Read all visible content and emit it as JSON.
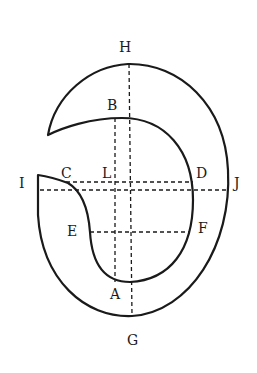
{
  "diagram": {
    "type": "geometric-construction",
    "stroke_color": "#1a1a1a",
    "background": "#ffffff",
    "labels": {
      "H": "H",
      "B": "B",
      "I": "I",
      "C": "C",
      "L": "L",
      "D": "D",
      "J": "J",
      "E": "E",
      "F": "F",
      "A": "A",
      "G": "G"
    },
    "points": [
      {
        "name": "H",
        "x": 128,
        "y": 65
      },
      {
        "name": "B",
        "x": 115,
        "y": 118
      },
      {
        "name": "I",
        "x": 38,
        "y": 190
      },
      {
        "name": "C",
        "x": 68,
        "y": 182
      },
      {
        "name": "L",
        "x": 115,
        "y": 182
      },
      {
        "name": "D",
        "x": 193,
        "y": 182
      },
      {
        "name": "J",
        "x": 228,
        "y": 190
      },
      {
        "name": "E",
        "x": 90,
        "y": 232
      },
      {
        "name": "F",
        "x": 190,
        "y": 232
      },
      {
        "name": "A",
        "x": 115,
        "y": 280
      },
      {
        "name": "G",
        "x": 132,
        "y": 315
      }
    ]
  }
}
